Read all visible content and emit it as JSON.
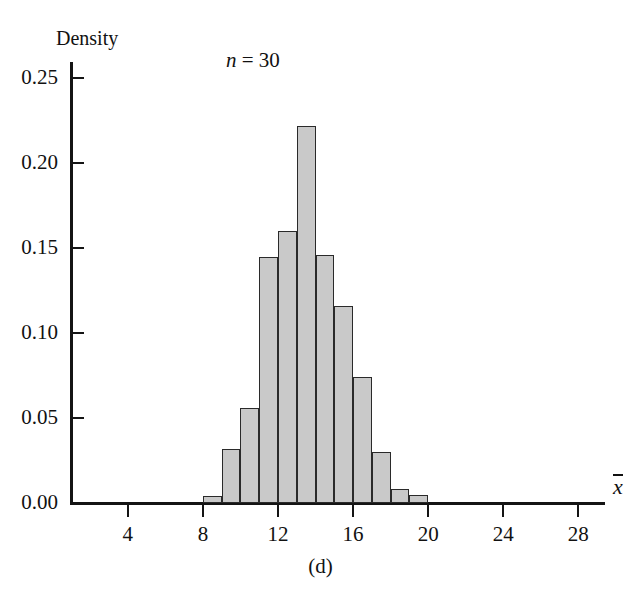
{
  "chart_data": {
    "type": "bar",
    "title": "",
    "subtitle": "",
    "annotation": "n = 30",
    "annotation_n_symbol": "n",
    "annotation_n_rest": " = 30",
    "caption": "(d)",
    "xlabel": "x̄",
    "xlabel_symbol": "x",
    "ylabel": "Density",
    "xlim": [
      1.0,
      29.2
    ],
    "ylim": [
      0.0,
      0.262
    ],
    "grid": false,
    "legend": false,
    "bin_width": 1,
    "bin_edges": [
      8,
      9,
      10,
      11,
      12,
      13,
      14,
      15,
      16,
      17,
      18,
      19,
      20
    ],
    "categories": [
      "8-9",
      "9-10",
      "10-11",
      "11-12",
      "12-13",
      "13-14",
      "14-15",
      "15-16",
      "16-17",
      "17-18",
      "18-19",
      "19-20"
    ],
    "values": [
      0.004,
      0.032,
      0.056,
      0.145,
      0.16,
      0.222,
      0.146,
      0.116,
      0.074,
      0.03,
      0.008,
      0.005
    ],
    "xticks": [
      4,
      8,
      12,
      16,
      20,
      24,
      28
    ],
    "xtick_labels": [
      "4",
      "8",
      "12",
      "16",
      "20",
      "24",
      "28"
    ],
    "yticks": [
      0.0,
      0.05,
      0.1,
      0.15,
      0.2,
      0.25
    ],
    "ytick_labels": [
      "0.00",
      "0.05",
      "0.10",
      "0.15",
      "0.20",
      "0.25"
    ],
    "bar_fill_color": "#c9c9c9",
    "bar_edge_color": "#2a2a2a",
    "axis_color": "#141414"
  }
}
